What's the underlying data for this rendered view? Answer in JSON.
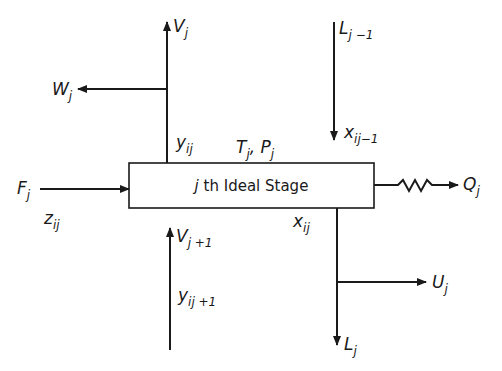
{
  "diagram": {
    "stage_label": {
      "prefix": "j",
      "text": "th Ideal Stage"
    },
    "stage_conditions": {
      "T": "T",
      "T_sub": "j",
      "sep": ", ",
      "P": "P",
      "P_sub": "j"
    },
    "streams": {
      "vapor_out": {
        "main": "V",
        "sub": "j"
      },
      "vapor_sidedraw": {
        "main": "W",
        "sub": "j"
      },
      "vapor_out_comp": {
        "main": "y",
        "sub": "ij"
      },
      "liquid_in": {
        "main": "L",
        "sub": "j −1"
      },
      "liquid_in_comp": {
        "main": "x",
        "sub": "ij−1"
      },
      "feed": {
        "main": "F",
        "sub": "j"
      },
      "feed_comp": {
        "main": "z",
        "sub": "ij"
      },
      "heat": {
        "main": "Q",
        "sub": "j"
      },
      "vapor_in": {
        "main": "V",
        "sub": "j +1"
      },
      "vapor_in_comp": {
        "main": "y",
        "sub": "ij +1"
      },
      "liquid_out_comp": {
        "main": "x",
        "sub": "ij"
      },
      "liquid_sidedraw": {
        "main": "U",
        "sub": "j"
      },
      "liquid_out": {
        "main": "L",
        "sub": "j"
      }
    },
    "colors": {
      "line": "#1a1a1a",
      "background": "#ffffff"
    }
  }
}
